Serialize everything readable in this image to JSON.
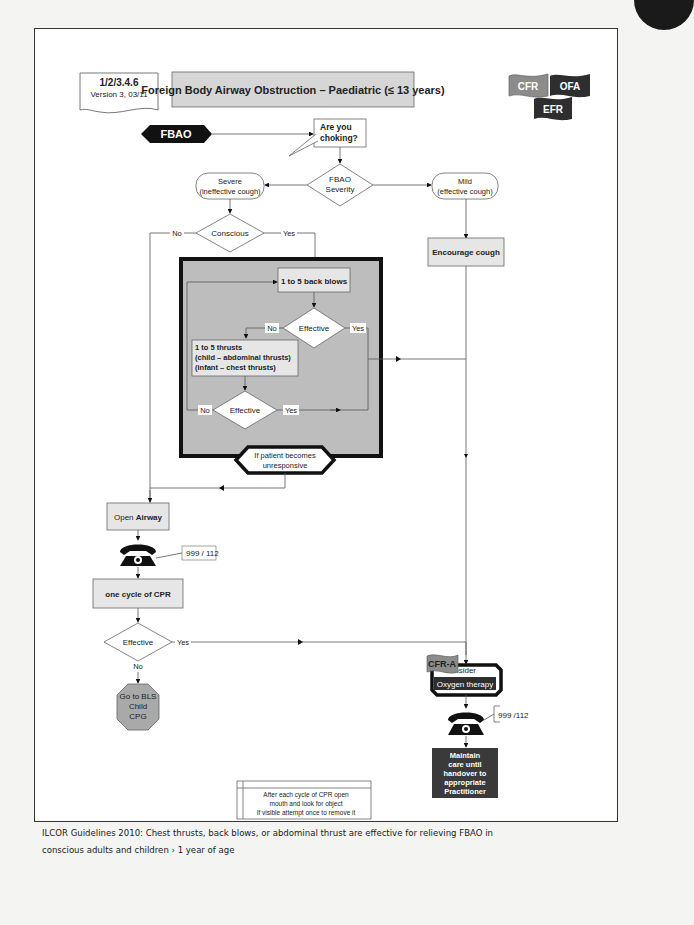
{
  "header": {
    "code": "1/2/3.4.6",
    "version": "Version 3, 03/11",
    "title": "Foreign Body Airway Obstruction – Paediatric (≤ 13 years)",
    "badges": [
      {
        "label": "CFR",
        "color": "#8c8c8c"
      },
      {
        "label": "OFA",
        "color": "#2e2e2e"
      },
      {
        "label": "EFR",
        "color": "#2e2e2e"
      }
    ]
  },
  "flow": {
    "start": "FBAO",
    "choking_line1": "Are you",
    "choking_line2": "choking?",
    "severity_line1": "FBAO",
    "severity_line2": "Severity",
    "severe_line1": "Severe",
    "severe_line2": "(ineffective cough)",
    "mild_line1": "Mild",
    "mild_line2": "(effective cough)",
    "encourage_cough": "Encourage cough",
    "conscious": "Conscious",
    "no": "No",
    "yes": "Yes",
    "back_blows": "1 to 5 back blows",
    "effective": "Effective",
    "thrusts_line1": "1 to 5 thrusts",
    "thrusts_line2": "(child – abdominal thrusts)",
    "thrusts_line3": "(infant – chest thrusts)",
    "unresponsive_line1": "If patient becomes",
    "unresponsive_line2": "unresponsive",
    "open_airway_a": "Open ",
    "open_airway_b": "Airway",
    "phone_number_1": "999 / 112",
    "cpr_cycle": "one cycle of CPR",
    "bls_line1": "Go to BLS",
    "bls_line2": "Child",
    "bls_line3": "CPG",
    "cfra_badge": "CFR-A",
    "consider": "Consider",
    "oxygen": "Oxygen therapy",
    "phone_number_2": "999 /112",
    "maintain_lines": [
      "Maintain",
      "care until",
      "handover to",
      "appropriate",
      "Practitioner"
    ],
    "note_lines": [
      "After each cycle of CPR open",
      "mouth and look for object",
      "If visible attempt once to remove it"
    ]
  },
  "footer": {
    "line1": "ILCOR Guidelines 2010: Chest thrusts, back blows, or abdominal thrust are effective for relieving FBAO in",
    "line2": "conscious adults and children › 1 year of age"
  },
  "colors": {
    "box_fill": "#e6e6e6",
    "region_fill": "#bdbdbd",
    "dark": "#2e2e2e",
    "octagon_fill": "#a9a9a9"
  }
}
